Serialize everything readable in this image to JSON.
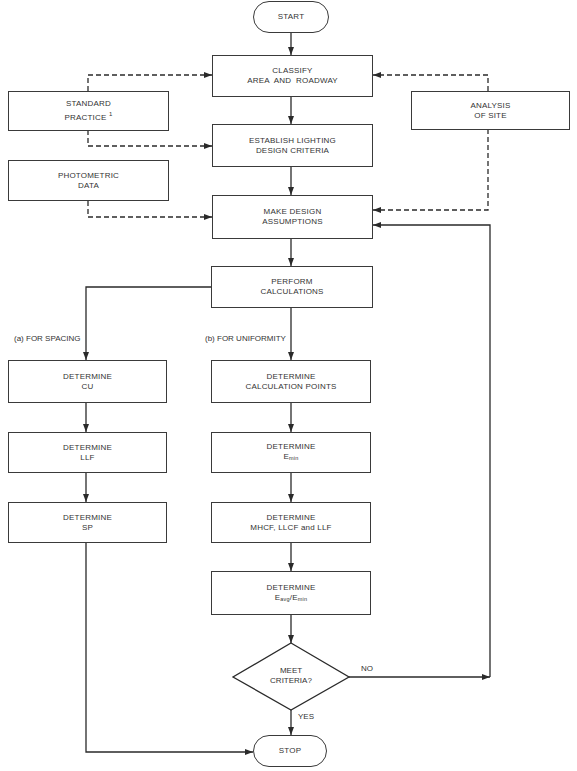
{
  "diagram": {
    "type": "flowchart",
    "nodes": {
      "start": {
        "label": "START"
      },
      "classify": {
        "line1": "CLASSIFY",
        "line2": "AREA  AND  ROADWAY"
      },
      "standard_practice": {
        "line1": "STANDARD",
        "line2": "PRACTICE",
        "footnote": "1"
      },
      "analysis_of_site": {
        "line1": "ANALYSIS",
        "line2": "OF SITE"
      },
      "establish_criteria": {
        "line1": "ESTABLISH LIGHTING",
        "line2": "DESIGN CRITERIA"
      },
      "photometric_data": {
        "line1": "PHOTOMETRIC",
        "line2": "DATA"
      },
      "make_assumptions": {
        "line1": "MAKE DESIGN",
        "line2": "ASSUMPTIONS"
      },
      "perform_calculations": {
        "line1": "PERFORM",
        "line2": "CALCULATIONS"
      },
      "determine_cu": {
        "line1": "DETERMINE",
        "line2": "CU"
      },
      "determine_llf_a": {
        "line1": "DETERMINE",
        "line2": "LLF"
      },
      "determine_sp": {
        "line1": "DETERMINE",
        "line2": "SP"
      },
      "determine_calc_points": {
        "line1": "DETERMINE",
        "line2": "CALCULATION POINTS"
      },
      "determine_emin": {
        "line1": "DETERMINE",
        "base": "E",
        "sub": "min"
      },
      "determine_factors": {
        "line1": "DETERMINE",
        "line2": "MHCF, LLCF and LLF"
      },
      "determine_ratio": {
        "line1": "DETERMINE",
        "base1": "E",
        "sub1": "avg",
        "slash": "/",
        "base2": "E",
        "sub2": "min"
      },
      "meet_criteria": {
        "line1": "MEET",
        "line2": "CRITERIA?"
      },
      "stop": {
        "label": "STOP"
      }
    },
    "branch_labels": {
      "spacing": "(a) FOR SPACING",
      "uniformity": "(b) FOR UNIFORMITY",
      "no": "NO",
      "yes": "YES"
    },
    "edges": [
      {
        "from": "start",
        "to": "classify",
        "style": "solid"
      },
      {
        "from": "classify",
        "to": "establish_criteria",
        "style": "solid"
      },
      {
        "from": "standard_practice",
        "to": "classify",
        "style": "dashed"
      },
      {
        "from": "standard_practice",
        "to": "establish_criteria",
        "style": "dashed"
      },
      {
        "from": "analysis_of_site",
        "to": "classify",
        "style": "dashed"
      },
      {
        "from": "analysis_of_site",
        "to": "make_assumptions",
        "style": "dashed"
      },
      {
        "from": "establish_criteria",
        "to": "make_assumptions",
        "style": "solid"
      },
      {
        "from": "photometric_data",
        "to": "make_assumptions",
        "style": "dashed"
      },
      {
        "from": "make_assumptions",
        "to": "perform_calculations",
        "style": "solid"
      },
      {
        "from": "perform_calculations",
        "to": "determine_cu",
        "style": "solid",
        "label": "(a) FOR SPACING"
      },
      {
        "from": "perform_calculations",
        "to": "determine_calc_points",
        "style": "solid",
        "label": "(b) FOR UNIFORMITY"
      },
      {
        "from": "determine_cu",
        "to": "determine_llf_a",
        "style": "solid"
      },
      {
        "from": "determine_llf_a",
        "to": "determine_sp",
        "style": "solid"
      },
      {
        "from": "determine_sp",
        "to": "stop",
        "style": "solid"
      },
      {
        "from": "determine_calc_points",
        "to": "determine_emin",
        "style": "solid"
      },
      {
        "from": "determine_emin",
        "to": "determine_factors",
        "style": "solid"
      },
      {
        "from": "determine_factors",
        "to": "determine_ratio",
        "style": "solid"
      },
      {
        "from": "determine_ratio",
        "to": "meet_criteria",
        "style": "solid"
      },
      {
        "from": "meet_criteria",
        "to": "make_assumptions",
        "style": "solid",
        "label": "NO"
      },
      {
        "from": "meet_criteria",
        "to": "stop",
        "style": "solid",
        "label": "YES"
      }
    ],
    "colors": {
      "line": "#2a2a2a",
      "background": "#ffffff"
    }
  }
}
